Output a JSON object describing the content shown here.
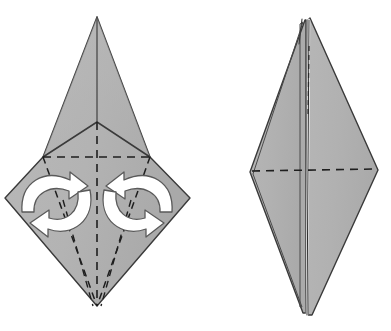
{
  "document": {
    "kind": "origami-fold-diagram",
    "step_description": "Petal/swivel fold: two pairs of rotation arrows on the left model indicate the front flaps swing inward, producing the narrowed layered model on the right.",
    "figure_count": 2
  },
  "style": {
    "paper_fill": "#b4b4b4",
    "paper_fill_shadow": "#a8a8a8",
    "paper_fill_light": "#bdbdbd",
    "outline_color": "#3a3a3a",
    "crease_color": "#1e1e1e",
    "arrow_fill": "#ffffff",
    "arrow_stroke": "#4a4a4a",
    "background": "#ffffff",
    "outline_width": "1.4",
    "crease_width": "1.5",
    "crease_dash": "7,5"
  },
  "figures": [
    {
      "id": "left-model",
      "name": "kite-base-with-rotation-arrows",
      "label": "Left model before folding",
      "outline_points": "97,17 150,157 190,198 97,306 5,198 43,157",
      "top_apex": {
        "x": 97,
        "y": 17
      },
      "bottom_apex": {
        "x": 97,
        "y": 306
      },
      "left_point": {
        "x": 5,
        "y": 198
      },
      "right_point": {
        "x": 190,
        "y": 198
      },
      "left_shoulder": {
        "x": 43,
        "y": 157
      },
      "right_shoulder": {
        "x": 150,
        "y": 157
      },
      "center_vertex": {
        "x": 97,
        "y": 122
      },
      "solid_creases": [
        {
          "name": "left-flap-edge",
          "points": "97,122 43,157"
        },
        {
          "name": "right-flap-edge",
          "points": "97,122 150,157"
        },
        {
          "name": "upper-spine",
          "points": "97,17 97,122"
        }
      ],
      "dashed_creases": [
        {
          "name": "vertical-center-crease",
          "points": "97,122 97,306"
        },
        {
          "name": "horizontal-crease",
          "points": "43,157 150,157"
        },
        {
          "name": "left-diagonal-crease",
          "points": "43,157 97,306"
        },
        {
          "name": "right-diagonal-crease",
          "points": "150,157 97,306"
        },
        {
          "name": "left-inner-crease",
          "points": "63,200 93,306"
        },
        {
          "name": "right-inner-crease",
          "points": "131,200 101,306"
        }
      ],
      "arrows": [
        {
          "name": "upper-left-rotation-arrow",
          "direction": "clockwise"
        },
        {
          "name": "lower-left-rotation-arrow",
          "direction": "counter-clockwise"
        },
        {
          "name": "upper-right-rotation-arrow",
          "direction": "counter-clockwise"
        },
        {
          "name": "lower-right-rotation-arrow",
          "direction": "clockwise"
        }
      ]
    },
    {
      "id": "right-model",
      "name": "narrowed-layered-model",
      "label": "Right model after folding",
      "outline_points": "310,18 378,170 312,315 250,172",
      "top_apex": {
        "x": 310,
        "y": 18
      },
      "bottom_apex": {
        "x": 312,
        "y": 315
      },
      "left_point": {
        "x": 250,
        "y": 172
      },
      "right_point": {
        "x": 378,
        "y": 170
      },
      "center_gap_x": 307,
      "solid_creases": [
        {
          "name": "center-spine",
          "points": "309,20 307,315"
        },
        {
          "name": "left-layer-edge",
          "points": "305,22 252,174"
        },
        {
          "name": "left-lower-layer-edge",
          "points": "252,174 303,313"
        },
        {
          "name": "second-peak",
          "points": "303,20 300,40"
        }
      ],
      "dashed_creases": [
        {
          "name": "horizontal-crease",
          "points": "252,171 376,169"
        },
        {
          "name": "upper-spine-crease",
          "points": "309,45 308,120"
        }
      ]
    }
  ]
}
